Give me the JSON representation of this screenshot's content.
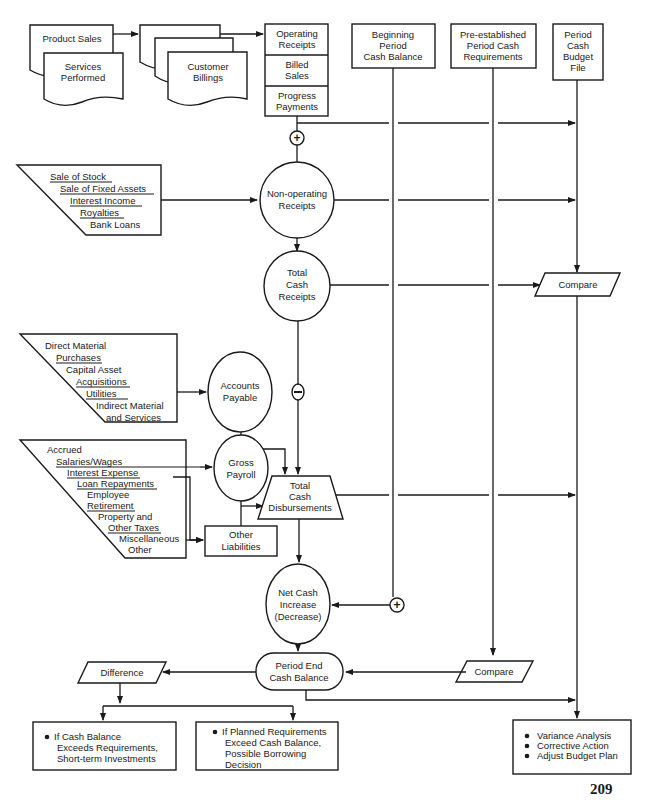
{
  "sources": {
    "product_sales": "Product Sales",
    "services_performed": [
      "Services",
      "Performed"
    ],
    "customer_billings": [
      "Customer",
      "Billings"
    ],
    "receipts_file": {
      "rows": [
        [
          "Operating",
          "Receipts"
        ],
        [
          "Billed",
          "Sales"
        ],
        [
          "Progress",
          "Payments"
        ]
      ]
    },
    "beginning_balance": [
      "Beginning",
      "Period",
      "Cash Balance"
    ],
    "pre_established": [
      "Pre-established",
      "Period Cash",
      "Requirements"
    ],
    "budget_file": [
      "Period",
      "Cash",
      "Budget",
      "File"
    ]
  },
  "non_operating_inputs": [
    "Sale of Stock",
    "Sale of Fixed Assets",
    "Interest Income",
    "Royalties",
    "Bank Loans"
  ],
  "purchase_inputs": [
    "Direct Material",
    "Purchases",
    "Capital Asset",
    "Acquisitions",
    "Utilities",
    "Indirect Material",
    "and Services"
  ],
  "payroll_inputs": [
    "Accrued",
    "Salaries/Wages",
    "Interest Expense",
    "Loan Repayments",
    "Employee",
    "Retirement",
    "Property and",
    "Other Taxes",
    "Miscellaneous",
    "Other"
  ],
  "processes": {
    "non_operating_receipts": [
      "Non-operating",
      "Receipts"
    ],
    "total_cash_receipts": [
      "Total",
      "Cash",
      "Receipts"
    ],
    "accounts_payable": [
      "Accounts",
      "Payable"
    ],
    "gross_payroll": [
      "Gross",
      "Payroll"
    ],
    "other_liabilities": [
      "Other",
      "Liabilities"
    ],
    "total_cash_disbursements": [
      "Total",
      "Cash",
      "Disbursements"
    ],
    "net_cash": [
      "Net Cash",
      "Increase",
      "(Decrease)"
    ],
    "period_end_balance": [
      "Period End",
      "Cash Balance"
    ],
    "compare_top": "Compare",
    "compare_bottom": "Compare",
    "difference": "Difference"
  },
  "operators": {
    "plus": "+",
    "minus": "−"
  },
  "outcomes": {
    "investments": [
      "If Cash Balance",
      "Exceeds Requirements,",
      "Short-term Investments"
    ],
    "borrowing": [
      "If Planned Requirements",
      "Exceed Cash Balance,",
      "Possible Borrowing",
      "Decision"
    ],
    "actions": [
      "Variance Analysis",
      "Corrective Action",
      "Adjust Budget Plan"
    ]
  },
  "page_number": "209"
}
